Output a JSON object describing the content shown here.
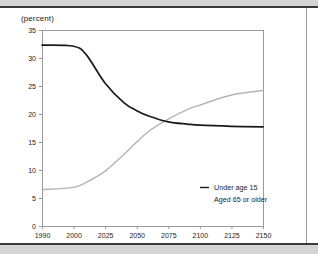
{
  "chart_data": {
    "type": "line",
    "title": "",
    "subtitle": "",
    "xlabel": "",
    "ylabel": "(percent)",
    "ylim": [
      0,
      35
    ],
    "xlim": [
      1990,
      2150
    ],
    "grid": false,
    "legend_position": "inside-bottom-right",
    "y_ticks": [
      "0",
      "5",
      "10",
      "15",
      "20",
      "25",
      "30",
      "35"
    ],
    "y_tick_values": [
      0,
      5,
      10,
      15,
      20,
      25,
      30,
      35
    ],
    "x_ticks": [
      "1990",
      "2000",
      "2025",
      "2050",
      "2075",
      "2100",
      "2125",
      "2150"
    ],
    "x_tick_values": [
      1990,
      2000,
      2025,
      2050,
      2075,
      2100,
      2125,
      2150
    ],
    "x": [
      1990,
      2000,
      2010,
      2025,
      2040,
      2050,
      2060,
      2075,
      2090,
      2100,
      2125,
      2150
    ],
    "series": [
      {
        "name": "Under age 15",
        "color": "#1a1a1a",
        "values": [
          32.3,
          32.1,
          30.6,
          25.5,
          22.0,
          20.6,
          19.6,
          18.6,
          18.2,
          18.0,
          17.8,
          17.7
        ]
      },
      {
        "name": "Aged 65 or older",
        "color": "#b4b4b4",
        "values": [
          6.5,
          6.9,
          7.8,
          9.8,
          12.8,
          15.0,
          17.0,
          19.1,
          20.8,
          21.6,
          23.4,
          24.2
        ]
      }
    ],
    "legend": [
      {
        "label": "Under age 15",
        "color": "#1a1a1a",
        "swatch": true
      },
      {
        "label": "Aged 65 or older",
        "color": "#b4b4b4",
        "swatch": false
      }
    ],
    "annotations": []
  },
  "page": {
    "axis_title": "(percent)"
  },
  "colors": {
    "band": "#d4d4d4",
    "rule": "#3a3a3a",
    "frame": "#9a9a9a",
    "series_dark": "#1a1a1a",
    "series_light": "#b4b4b4",
    "text": "#1c1c1c"
  }
}
